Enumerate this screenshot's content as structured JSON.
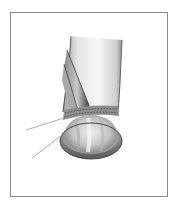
{
  "figure": {
    "type": "medical-illustration",
    "style": "grayscale",
    "labels": [],
    "leader_lines": [
      {
        "name": "leader-line-upper",
        "from": [
          26,
          130
        ],
        "to": [
          64,
          118
        ]
      },
      {
        "name": "leader-line-lower",
        "from": [
          32,
          158
        ],
        "to": [
          62,
          135
        ]
      }
    ],
    "colors": {
      "frame": "#8a8a8a",
      "background": "#ffffff",
      "tissue_light": "#f2f2f2",
      "tissue_mid": "#bdbdbd",
      "tissue_dark": "#4a4a4a",
      "leader": "#9a9a9a"
    }
  }
}
